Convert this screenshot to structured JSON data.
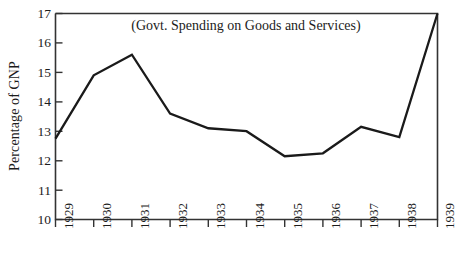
{
  "chart_data": {
    "type": "line",
    "title": "(Govt. Spending on Goods and Services)",
    "xlabel": "",
    "ylabel": "Percentage of GNP",
    "categories": [
      "1929",
      "1930",
      "1931",
      "1932",
      "1933",
      "1934",
      "1935",
      "1936",
      "1937",
      "1938",
      "1939"
    ],
    "values": [
      12.75,
      14.9,
      15.6,
      13.6,
      13.1,
      13.0,
      12.15,
      12.25,
      13.15,
      12.8,
      17.0
    ],
    "x": [
      1929,
      1930,
      1931,
      1932,
      1933,
      1934,
      1935,
      1936,
      1937,
      1938,
      1939
    ],
    "ylim": [
      10,
      17
    ],
    "yticks": [
      10,
      11,
      12,
      13,
      14,
      15,
      16,
      17
    ],
    "ytick_labels": [
      "10",
      "11",
      "12",
      "13",
      "14",
      "15",
      "16",
      "17"
    ],
    "xtick_labels": [
      "1929",
      "1930",
      "1931",
      "1932",
      "1933",
      "1934",
      "1935",
      "1936",
      "1937",
      "1938",
      "1939"
    ],
    "grid": false,
    "legend": false,
    "legend_position": "none",
    "series": [
      {
        "name": "Govt. Spending on Goods and Services",
        "values": [
          12.75,
          14.9,
          15.6,
          13.6,
          13.1,
          13.0,
          12.15,
          12.25,
          13.15,
          12.8,
          17.0
        ],
        "color": "#1a1a1a"
      }
    ],
    "annotations": [],
    "line_color": "#1a1a1a",
    "axis_color": "#333333",
    "background_color": "#ffffff",
    "x_tick_rotation": -90,
    "y_label_rotation": -90
  }
}
